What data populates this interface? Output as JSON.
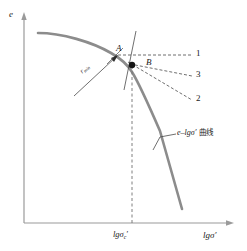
{
  "figure": {
    "kind": "e-lg-sigma compression curve with Casagrande construction",
    "width": 247,
    "height": 251,
    "background": "#ffffff"
  },
  "axes": {
    "y_label": "e",
    "x_label_main": "lgσ′",
    "x_tick_label": {
      "base": "lgσ",
      "subscript": "c",
      "prime": "′"
    },
    "axis_color": "#9a9a9a"
  },
  "curve": {
    "label_math": "e–lgσ′",
    "label_cn": "曲线",
    "color": "#8c8c8c",
    "stroke_width": 2.6
  },
  "points": [
    {
      "id": "A",
      "label": "A",
      "x": 117,
      "y": 57,
      "kind": "tangency-point-on-curve"
    },
    {
      "id": "B",
      "label": "B",
      "x": 146,
      "y": 63,
      "kind": "construction-label"
    }
  ],
  "marker_dot": {
    "x": 132,
    "y": 65,
    "radius": 3.2,
    "color": "#151515",
    "name": "minimum-radius-point"
  },
  "ray_labels": [
    {
      "id": "1",
      "label": "1",
      "x": 198,
      "y": 52,
      "description": "horizontal line through A"
    },
    {
      "id": "3",
      "label": "3",
      "x": 198,
      "y": 73,
      "description": "bisector line"
    },
    {
      "id": "2",
      "label": "2",
      "x": 198,
      "y": 97,
      "description": "tangent line at minimum radius"
    }
  ],
  "radius_label": {
    "base": "r",
    "subscript": "min",
    "x": 84,
    "y": 72
  },
  "dashed_style": {
    "color": "#4a4a4a",
    "dash": "3 2",
    "width": 0.8
  },
  "vertical_dropline": {
    "from_y": 65,
    "to_y": 223,
    "x": 132,
    "color": "#6f6f6f"
  },
  "colors": {
    "ink": "#1a1a1a",
    "axis": "#9a9a9a",
    "curve": "#8c8c8c",
    "dashed": "#4a4a4a",
    "dot": "#151515"
  }
}
